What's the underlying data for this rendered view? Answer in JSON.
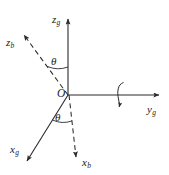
{
  "figure": {
    "background_color": "#ffffff",
    "stroke_color": "#2b2b2b",
    "text_color": "#1a1a1a",
    "width": 169,
    "height": 175
  },
  "origin": {
    "label": "O",
    "x": 68,
    "y": 95
  },
  "axes": [
    {
      "id": "z-ground",
      "base": "z",
      "subscript": "g",
      "style": "solid",
      "frame": "ground",
      "direction": "up",
      "label_x": 52,
      "label_y": 14,
      "from": [
        68,
        95
      ],
      "to": [
        68,
        18
      ]
    },
    {
      "id": "y-ground",
      "base": "y",
      "subscript": "g",
      "style": "solid",
      "frame": "ground",
      "direction": "right",
      "label_x": 148,
      "label_y": 104,
      "from": [
        68,
        95
      ],
      "to": [
        160,
        95
      ]
    },
    {
      "id": "x-ground",
      "base": "x",
      "subscript": "g",
      "style": "solid",
      "frame": "ground",
      "direction": "down-left",
      "label_x": 11,
      "label_y": 145,
      "from": [
        68,
        95
      ],
      "to": [
        26,
        163
      ]
    },
    {
      "id": "z-body",
      "base": "z",
      "subscript": "b",
      "style": "dashed",
      "frame": "body",
      "direction": "up-left",
      "label_x": 7,
      "label_y": 38,
      "from": [
        68,
        95
      ],
      "to": [
        22,
        33
      ]
    },
    {
      "id": "x-body",
      "base": "x",
      "subscript": "b",
      "style": "dashed",
      "frame": "body",
      "direction": "down",
      "label_x": 82,
      "label_y": 159,
      "from": [
        68,
        95
      ],
      "to": [
        76,
        160
      ]
    }
  ],
  "angles": [
    {
      "id": "theta-upper",
      "symbol": "θ",
      "between": [
        "z-body",
        "z-ground"
      ],
      "label_x": 52,
      "label_y": 57
    },
    {
      "id": "theta-lower",
      "symbol": "θ",
      "between": [
        "x-ground",
        "x-body"
      ],
      "label_x": 56,
      "label_y": 113
    }
  ],
  "rotation_indicator": {
    "id": "rotation-about-y",
    "about_axis": "y-ground",
    "x": 122,
    "y": 95,
    "description": "curved arrow indicating rotation about the y-ground axis"
  }
}
